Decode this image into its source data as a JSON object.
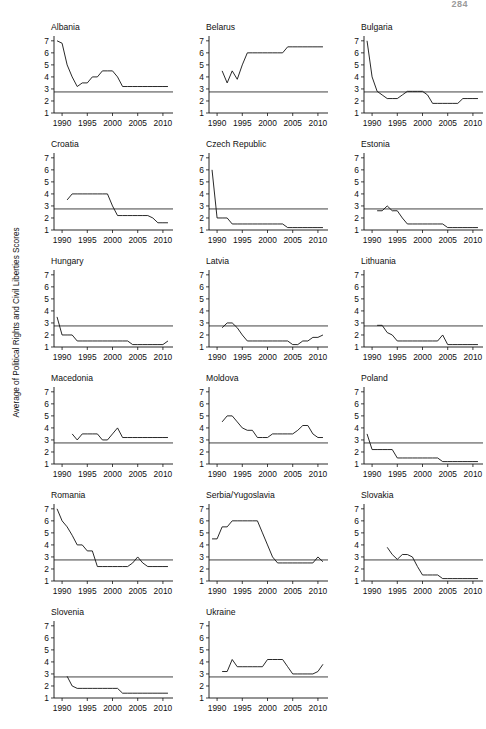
{
  "page": {
    "number": "284"
  },
  "figure": {
    "ylabel": "Average of Political Rights and Civil Liberties Scores",
    "y_ticks": [
      "7",
      "6",
      "5",
      "4",
      "3",
      "2",
      "1"
    ],
    "x_ticks": [
      "1990",
      "1995",
      "2000",
      "2005",
      "2010"
    ]
  },
  "chart_data": {
    "type": "line",
    "title": "",
    "xlabel": "",
    "ylabel": "Average of Political Rights and Civil Liberties Scores",
    "xlim": [
      1988,
      2012
    ],
    "ylim": [
      1,
      7.4
    ],
    "yticks": [
      1,
      2,
      3,
      4,
      5,
      6,
      7
    ],
    "xticks": [
      1990,
      1995,
      2000,
      2005,
      2010
    ],
    "grid": false,
    "legend": "none",
    "reference_line_y": 2.75,
    "panels": [
      {
        "name": "Albania",
        "x": [
          1989,
          1990,
          1991,
          1992,
          1993,
          1994,
          1995,
          1996,
          1997,
          1998,
          1999,
          2000,
          2001,
          2002,
          2003,
          2004,
          2005,
          2006,
          2007,
          2008,
          2009,
          2010,
          2011
        ],
        "y": [
          7.0,
          6.8,
          5.0,
          4.0,
          3.2,
          3.5,
          3.5,
          4.0,
          4.0,
          4.5,
          4.5,
          4.5,
          4.0,
          3.2,
          3.2,
          3.2,
          3.2,
          3.2,
          3.2,
          3.2,
          3.2,
          3.2,
          3.2
        ]
      },
      {
        "name": "Belarus",
        "x": [
          1991,
          1992,
          1993,
          1994,
          1995,
          1996,
          1997,
          1998,
          1999,
          2000,
          2001,
          2002,
          2003,
          2004,
          2005,
          2006,
          2007,
          2008,
          2009,
          2010,
          2011
        ],
        "y": [
          4.5,
          3.5,
          4.5,
          3.8,
          5.0,
          6.0,
          6.0,
          6.0,
          6.0,
          6.0,
          6.0,
          6.0,
          6.0,
          6.5,
          6.5,
          6.5,
          6.5,
          6.5,
          6.5,
          6.5,
          6.5
        ]
      },
      {
        "name": "Bulgaria",
        "x": [
          1989,
          1990,
          1991,
          1992,
          1993,
          1994,
          1995,
          1996,
          1997,
          1998,
          1999,
          2000,
          2001,
          2002,
          2003,
          2004,
          2005,
          2006,
          2007,
          2008,
          2009,
          2010,
          2011
        ],
        "y": [
          7.0,
          4.0,
          2.8,
          2.5,
          2.2,
          2.2,
          2.2,
          2.5,
          2.8,
          2.8,
          2.8,
          2.8,
          2.5,
          1.8,
          1.8,
          1.8,
          1.8,
          1.8,
          1.8,
          2.2,
          2.2,
          2.2,
          2.2
        ]
      },
      {
        "name": "Croatia",
        "x": [
          1991,
          1992,
          1993,
          1994,
          1995,
          1996,
          1997,
          1998,
          1999,
          2000,
          2001,
          2002,
          2003,
          2004,
          2005,
          2006,
          2007,
          2008,
          2009,
          2010,
          2011
        ],
        "y": [
          3.5,
          4.0,
          4.0,
          4.0,
          4.0,
          4.0,
          4.0,
          4.0,
          4.0,
          3.0,
          2.2,
          2.2,
          2.2,
          2.2,
          2.2,
          2.2,
          2.2,
          2.0,
          1.6,
          1.6,
          1.6
        ]
      },
      {
        "name": "Czech Republic",
        "x": [
          1989,
          1990,
          1991,
          1992,
          1993,
          1994,
          1995,
          1996,
          1997,
          1998,
          1999,
          2000,
          2001,
          2002,
          2003,
          2004,
          2005,
          2006,
          2007,
          2008,
          2009,
          2010,
          2011
        ],
        "y": [
          6.0,
          2.0,
          2.0,
          2.0,
          1.5,
          1.5,
          1.5,
          1.5,
          1.5,
          1.5,
          1.5,
          1.5,
          1.5,
          1.5,
          1.5,
          1.2,
          1.2,
          1.2,
          1.2,
          1.2,
          1.2,
          1.2,
          1.2
        ]
      },
      {
        "name": "Estonia",
        "x": [
          1991,
          1992,
          1993,
          1994,
          1995,
          1996,
          1997,
          1998,
          1999,
          2000,
          2001,
          2002,
          2003,
          2004,
          2005,
          2006,
          2007,
          2008,
          2009,
          2010,
          2011
        ],
        "y": [
          2.6,
          2.6,
          3.0,
          2.6,
          2.6,
          2.0,
          1.5,
          1.5,
          1.5,
          1.5,
          1.5,
          1.5,
          1.5,
          1.5,
          1.2,
          1.2,
          1.2,
          1.2,
          1.2,
          1.2,
          1.2
        ]
      },
      {
        "name": "Hungary",
        "x": [
          1989,
          1990,
          1991,
          1992,
          1993,
          1994,
          1995,
          1996,
          1997,
          1998,
          1999,
          2000,
          2001,
          2002,
          2003,
          2004,
          2005,
          2006,
          2007,
          2008,
          2009,
          2010,
          2011
        ],
        "y": [
          3.5,
          2.0,
          2.0,
          2.0,
          1.5,
          1.5,
          1.5,
          1.5,
          1.5,
          1.5,
          1.5,
          1.5,
          1.5,
          1.5,
          1.5,
          1.2,
          1.2,
          1.2,
          1.2,
          1.2,
          1.2,
          1.2,
          1.5
        ]
      },
      {
        "name": "Latvia",
        "x": [
          1991,
          1992,
          1993,
          1994,
          1995,
          1996,
          1997,
          1998,
          1999,
          2000,
          2001,
          2002,
          2003,
          2004,
          2005,
          2006,
          2007,
          2008,
          2009,
          2010,
          2011
        ],
        "y": [
          2.6,
          3.0,
          3.0,
          2.6,
          2.0,
          1.5,
          1.5,
          1.5,
          1.5,
          1.5,
          1.5,
          1.5,
          1.5,
          1.5,
          1.2,
          1.2,
          1.5,
          1.5,
          1.8,
          1.8,
          2.0
        ]
      },
      {
        "name": "Lithuania",
        "x": [
          1991,
          1992,
          1993,
          1994,
          1995,
          1996,
          1997,
          1998,
          1999,
          2000,
          2001,
          2002,
          2003,
          2004,
          2005,
          2006,
          2007,
          2008,
          2009,
          2010,
          2011
        ],
        "y": [
          2.8,
          2.8,
          2.2,
          2.0,
          1.5,
          1.5,
          1.5,
          1.5,
          1.5,
          1.5,
          1.5,
          1.5,
          1.5,
          2.0,
          1.2,
          1.2,
          1.2,
          1.2,
          1.2,
          1.2,
          1.2
        ]
      },
      {
        "name": "Macedonia",
        "x": [
          1992,
          1993,
          1994,
          1995,
          1996,
          1997,
          1998,
          1999,
          2000,
          2001,
          2002,
          2003,
          2004,
          2005,
          2006,
          2007,
          2008,
          2009,
          2010,
          2011
        ],
        "y": [
          3.5,
          3.0,
          3.5,
          3.5,
          3.5,
          3.5,
          3.0,
          3.0,
          3.5,
          4.0,
          3.2,
          3.2,
          3.2,
          3.2,
          3.2,
          3.2,
          3.2,
          3.2,
          3.2,
          3.2
        ]
      },
      {
        "name": "Moldova",
        "x": [
          1991,
          1992,
          1993,
          1994,
          1995,
          1996,
          1997,
          1998,
          1999,
          2000,
          2001,
          2002,
          2003,
          2004,
          2005,
          2006,
          2007,
          2008,
          2009,
          2010,
          2011
        ],
        "y": [
          4.5,
          5.0,
          5.0,
          4.5,
          4.0,
          3.8,
          3.8,
          3.2,
          3.2,
          3.2,
          3.5,
          3.5,
          3.5,
          3.5,
          3.5,
          3.8,
          4.2,
          4.2,
          3.5,
          3.2,
          3.2
        ]
      },
      {
        "name": "Poland",
        "x": [
          1989,
          1990,
          1991,
          1992,
          1993,
          1994,
          1995,
          1996,
          1997,
          1998,
          1999,
          2000,
          2001,
          2002,
          2003,
          2004,
          2005,
          2006,
          2007,
          2008,
          2009,
          2010,
          2011
        ],
        "y": [
          3.5,
          2.2,
          2.2,
          2.2,
          2.2,
          2.2,
          1.5,
          1.5,
          1.5,
          1.5,
          1.5,
          1.5,
          1.5,
          1.5,
          1.5,
          1.2,
          1.2,
          1.2,
          1.2,
          1.2,
          1.2,
          1.2,
          1.2
        ]
      },
      {
        "name": "Romania",
        "x": [
          1989,
          1990,
          1991,
          1992,
          1993,
          1994,
          1995,
          1996,
          1997,
          1998,
          1999,
          2000,
          2001,
          2002,
          2003,
          2004,
          2005,
          2006,
          2007,
          2008,
          2009,
          2010,
          2011
        ],
        "y": [
          7.0,
          6.0,
          5.5,
          4.8,
          4.0,
          4.0,
          3.5,
          3.5,
          2.2,
          2.2,
          2.2,
          2.2,
          2.2,
          2.2,
          2.2,
          2.5,
          3.0,
          2.5,
          2.2,
          2.2,
          2.2,
          2.2,
          2.2
        ]
      },
      {
        "name": "Serbia/Yugoslavia",
        "x": [
          1989,
          1990,
          1991,
          1992,
          1993,
          1994,
          1995,
          1996,
          1997,
          1998,
          1999,
          2000,
          2001,
          2002,
          2003,
          2004,
          2005,
          2006,
          2007,
          2008,
          2009,
          2010,
          2011
        ],
        "y": [
          4.5,
          4.5,
          5.5,
          5.5,
          6.0,
          6.0,
          6.0,
          6.0,
          6.0,
          6.0,
          5.0,
          4.0,
          3.0,
          2.5,
          2.5,
          2.5,
          2.5,
          2.5,
          2.5,
          2.5,
          2.5,
          3.0,
          2.6
        ]
      },
      {
        "name": "Slovakia",
        "x": [
          1993,
          1994,
          1995,
          1996,
          1997,
          1998,
          1999,
          2000,
          2001,
          2002,
          2003,
          2004,
          2005,
          2006,
          2007,
          2008,
          2009,
          2010,
          2011
        ],
        "y": [
          3.8,
          3.2,
          2.8,
          3.2,
          3.2,
          3.0,
          2.2,
          1.5,
          1.5,
          1.5,
          1.5,
          1.2,
          1.2,
          1.2,
          1.2,
          1.2,
          1.2,
          1.2,
          1.2
        ]
      },
      {
        "name": "Slovenia",
        "x": [
          1991,
          1992,
          1993,
          1994,
          1995,
          1996,
          1997,
          1998,
          1999,
          2000,
          2001,
          2002,
          2003,
          2004,
          2005,
          2006,
          2007,
          2008,
          2009,
          2010,
          2011
        ],
        "y": [
          2.8,
          2.0,
          1.8,
          1.8,
          1.8,
          1.8,
          1.8,
          1.8,
          1.8,
          1.8,
          1.8,
          1.4,
          1.4,
          1.4,
          1.4,
          1.4,
          1.4,
          1.4,
          1.4,
          1.4,
          1.4
        ]
      },
      {
        "name": "Ukraine",
        "x": [
          1991,
          1992,
          1993,
          1994,
          1995,
          1996,
          1997,
          1998,
          1999,
          2000,
          2001,
          2002,
          2003,
          2004,
          2005,
          2006,
          2007,
          2008,
          2009,
          2010,
          2011
        ],
        "y": [
          3.2,
          3.2,
          4.2,
          3.6,
          3.6,
          3.6,
          3.6,
          3.6,
          3.6,
          4.2,
          4.2,
          4.2,
          4.2,
          3.6,
          3.0,
          3.0,
          3.0,
          3.0,
          3.0,
          3.2,
          3.8
        ]
      }
    ]
  }
}
